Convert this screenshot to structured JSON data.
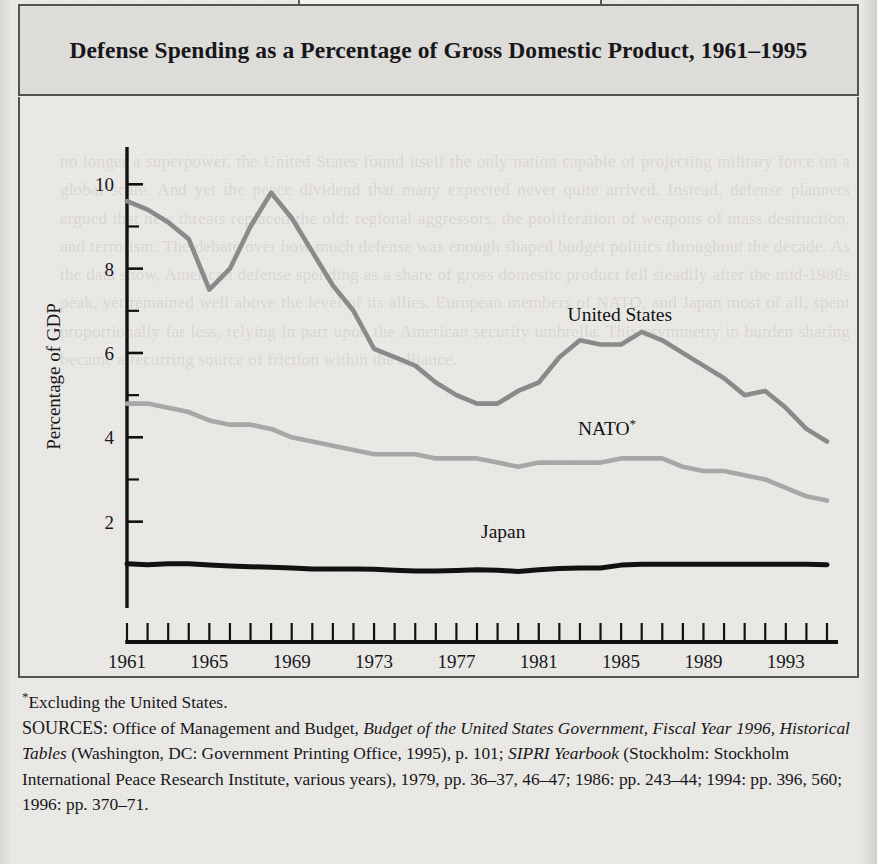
{
  "figure": {
    "label": "FIGURE 13.1",
    "title": "Defense Spending as a Percentage of Gross Domestic Product, 1961–1995"
  },
  "notes": {
    "footnote_marker": "*",
    "footnote": "Excluding the United States.",
    "sources_prefix": "SOURCES:",
    "sources_line1_a": " Office of Management and Budget, ",
    "sources_line1_i": "Budget of the United States Government, Fiscal Year 1996, Historical Tables",
    "sources_line1_b": " (Washington, DC: Government Printing Office, 1995), p. 101;",
    "sources_line2_i": "SIPRI Yearbook",
    "sources_line2_b": " (Stockholm: Stockholm International Peace Research Institute, various years), 1979, pp. 36–37, 46–47; 1986: pp. 243–44; 1994: pp. 396, 560; 1996: pp. 370–71."
  },
  "bleed_text": "no longer a superpower, the United States found itself the only nation capable of projecting military force on a global scale. And yet the peace dividend that many expected never quite arrived. Instead, defense planners argued that new threats replaced the old: regional aggressors, the proliferation of weapons of mass destruction, and terrorism. The debate over how much defense was enough shaped budget politics throughout the decade. As the data show, American defense spending as a share of gross domestic product fell steadily after the mid-1980s peak, yet remained well above the level of its allies. European members of NATO, and Japan most of all, spent proportionally far less, relying in part upon the American security umbrella. This asymmetry in burden sharing became a recurring source of friction within the alliance.",
  "chart_data": {
    "type": "line",
    "title": "Defense Spending as a Percentage of Gross Domestic Product, 1961–1995",
    "xlabel": "Fiscal Year",
    "ylabel": "Percentage of GDP",
    "xlim": [
      1961,
      1995
    ],
    "ylim": [
      0,
      10.6
    ],
    "yticks": [
      2,
      4,
      6,
      8,
      10
    ],
    "ytick_labels": [
      "2",
      "4",
      "6",
      "8",
      "10"
    ],
    "y_minor_ticks": [
      1,
      3,
      5,
      7,
      9
    ],
    "xticks": [
      1961,
      1965,
      1969,
      1973,
      1977,
      1981,
      1985,
      1989,
      1993
    ],
    "xtick_labels": [
      "1961",
      "1965",
      "1969",
      "1973",
      "1977",
      "1981",
      "1985",
      "1989",
      "1993"
    ],
    "x_minor_ticks_every": 1,
    "grid": false,
    "legend": "inline-labels",
    "x": [
      1961,
      1962,
      1963,
      1964,
      1965,
      1966,
      1967,
      1968,
      1969,
      1970,
      1971,
      1972,
      1973,
      1974,
      1975,
      1976,
      1977,
      1978,
      1979,
      1980,
      1981,
      1982,
      1983,
      1984,
      1985,
      1986,
      1987,
      1988,
      1989,
      1990,
      1991,
      1992,
      1993,
      1994,
      1995
    ],
    "series": [
      {
        "name": "United States",
        "color": "#8a8a8a",
        "label_x": 1982.4,
        "label_y": 6.75,
        "values": [
          9.6,
          9.4,
          9.1,
          8.7,
          7.5,
          8.0,
          9.0,
          9.8,
          9.2,
          8.4,
          7.6,
          7.0,
          6.1,
          5.9,
          5.7,
          5.3,
          5.0,
          4.8,
          4.8,
          5.1,
          5.3,
          5.9,
          6.3,
          6.2,
          6.2,
          6.5,
          6.3,
          6.0,
          5.7,
          5.4,
          5.0,
          5.1,
          4.7,
          4.2,
          3.9
        ]
      },
      {
        "name": "NATO*",
        "color": "#a7a7a7",
        "label_x": 1982.9,
        "label_y": 4.05,
        "values": [
          4.8,
          4.8,
          4.7,
          4.6,
          4.4,
          4.3,
          4.3,
          4.2,
          4.0,
          3.9,
          3.8,
          3.7,
          3.6,
          3.6,
          3.6,
          3.5,
          3.5,
          3.5,
          3.4,
          3.3,
          3.4,
          3.4,
          3.4,
          3.4,
          3.5,
          3.5,
          3.5,
          3.3,
          3.2,
          3.2,
          3.1,
          3.0,
          2.8,
          2.6,
          2.5
        ]
      },
      {
        "name": "Japan",
        "color": "#111111",
        "label_x": 1978.2,
        "label_y": 1.62,
        "values": [
          1.0,
          0.98,
          1.0,
          1.0,
          0.97,
          0.95,
          0.93,
          0.92,
          0.9,
          0.88,
          0.88,
          0.88,
          0.87,
          0.85,
          0.83,
          0.83,
          0.84,
          0.86,
          0.85,
          0.82,
          0.86,
          0.89,
          0.9,
          0.9,
          0.97,
          0.99,
          0.99,
          0.99,
          0.99,
          0.99,
          0.99,
          0.99,
          0.99,
          0.99,
          0.98
        ]
      }
    ]
  }
}
